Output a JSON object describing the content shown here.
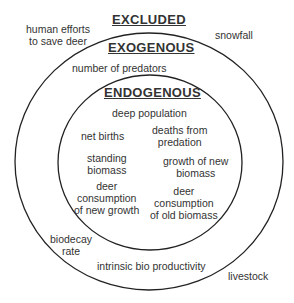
{
  "diagram": {
    "type": "nested-circles",
    "regions": {
      "excluded": {
        "title": "EXCLUDED",
        "items": [
          "human efforts to save deer",
          "snowfall",
          "livestock"
        ]
      },
      "exogenous": {
        "title": "EXOGENOUS",
        "items": [
          "number of predators",
          "biodecay rate",
          "intrinsic bio productivity"
        ]
      },
      "endogenous": {
        "title": "ENDOGENOUS",
        "items": [
          "deep population",
          "net births",
          "deaths from predation",
          "standing biomass",
          "growth of new biomass",
          "deer consumption of new growth",
          "deer consumption of old biomass"
        ]
      }
    },
    "labels": {
      "human_efforts_1": "human efforts",
      "human_efforts_2": "to save deer",
      "snowfall": "snowfall",
      "livestock": "livestock",
      "predators": "number of predators",
      "biodecay_1": "biodecay",
      "biodecay_2": "rate",
      "productivity": "intrinsic bio productivity",
      "deep_population": "deep population",
      "net_births": "net births",
      "deaths_1": "deaths from",
      "deaths_2": "predation",
      "standing_1": "standing",
      "standing_2": "biomass",
      "growth_1": "growth of new",
      "growth_2": "biomass",
      "cons_new_1": "deer",
      "cons_new_2": "consumption",
      "cons_new_3": "of new growth",
      "cons_old_1": "deer",
      "cons_old_2": "consumption",
      "cons_old_3": "of old biomass"
    }
  }
}
